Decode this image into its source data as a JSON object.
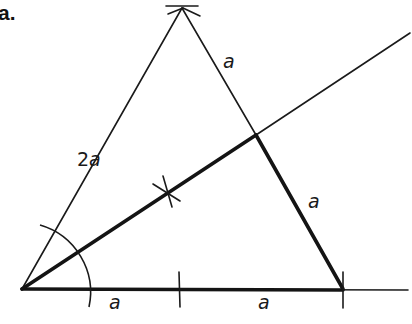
{
  "figure": {
    "part_label": "a."
  },
  "labels": {
    "hypotenuse": "2a",
    "upper_right_segment": "a",
    "right_side": "a",
    "base_left": "a",
    "base_right": "a"
  },
  "label_parts": {
    "hypotenuse_number": "2",
    "hypotenuse_var": "a"
  },
  "colors": {
    "ink": "#1a1a1a",
    "background": "#ffffff"
  }
}
